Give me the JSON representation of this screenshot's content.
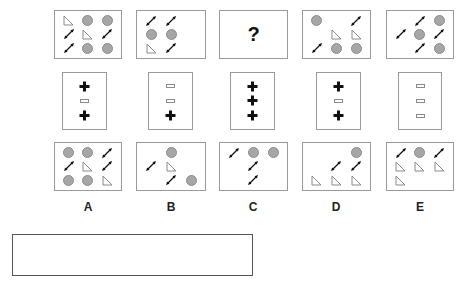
{
  "puzzle": {
    "question_mark": "?",
    "top_row": [
      {
        "id": "A",
        "cells": [
          "tri",
          "circ",
          "circ",
          "arr",
          "tri",
          "arr",
          "arr",
          "circ",
          "circ"
        ]
      },
      {
        "id": "B",
        "cells": [
          "arr",
          "arr",
          "",
          "circ",
          "circ",
          "",
          "tri",
          "arr",
          ""
        ]
      },
      {
        "id": "C",
        "unknown": true
      },
      {
        "id": "D",
        "cells": [
          "circ",
          "",
          "arr",
          "",
          "tri",
          "tri",
          "arr",
          "circ",
          "circ"
        ]
      },
      {
        "id": "E",
        "cells": [
          "",
          "arr",
          "circ",
          "arr",
          "circ",
          "arr",
          "",
          "arr",
          "circ"
        ]
      }
    ],
    "middle_row": [
      {
        "id": "A",
        "cells": [
          "plus",
          "rect",
          "plus"
        ]
      },
      {
        "id": "B",
        "cells": [
          "rect",
          "rect",
          "plus"
        ]
      },
      {
        "id": "C",
        "cells": [
          "plus",
          "plus",
          "plus"
        ]
      },
      {
        "id": "D",
        "cells": [
          "plus",
          "rect",
          "plus"
        ]
      },
      {
        "id": "E",
        "cells": [
          "rect",
          "rect",
          "rect"
        ]
      }
    ],
    "options": [
      {
        "label": "A",
        "cells": [
          "circ",
          "circ",
          "arr",
          "arr",
          "tri",
          "arr",
          "circ",
          "circ",
          "tri"
        ]
      },
      {
        "label": "B",
        "cells": [
          "",
          "circ",
          "",
          "arr",
          "tri",
          "",
          "",
          "arr",
          "circ"
        ]
      },
      {
        "label": "C",
        "cells": [
          "arr",
          "circ",
          "circ",
          "",
          "arr",
          "",
          "",
          "arr",
          ""
        ]
      },
      {
        "label": "D",
        "cells": [
          "",
          "",
          "circ",
          "",
          "arr",
          "arr",
          "tri",
          "tri",
          "tri"
        ]
      },
      {
        "label": "E",
        "cells": [
          "arr",
          "circ",
          "arr",
          "tri",
          "tri",
          "tri",
          "tri",
          "",
          ""
        ]
      }
    ],
    "answer_box": {
      "value": ""
    }
  },
  "colors": {
    "circle_fill": "#a6a6a6",
    "border": "#9a9a9a",
    "shape_dark": "#111111"
  }
}
